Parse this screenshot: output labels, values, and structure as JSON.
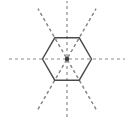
{
  "figure": {
    "caption": "",
    "canvas": {
      "width": 134,
      "height": 119,
      "background": "#ffffff"
    },
    "center": {
      "x": 67,
      "y": 59
    },
    "shape": {
      "name": "regular-hexagon",
      "sides": 6,
      "orientation": "flat-top",
      "circumradius": 24.5,
      "stroke_color": "#4a4a4a",
      "stroke_width": 1.4,
      "fill": "none",
      "vertices": [
        {
          "label": "right",
          "x": 91.5,
          "y": 59.0
        },
        {
          "label": "top-right",
          "x": 79.25,
          "y": 37.8
        },
        {
          "label": "top-left",
          "x": 54.75,
          "y": 37.8
        },
        {
          "label": "left",
          "x": 42.5,
          "y": 59.0
        },
        {
          "label": "bottom-left",
          "x": 54.75,
          "y": 80.2
        },
        {
          "label": "bottom-right",
          "x": 79.25,
          "y": 80.2
        }
      ]
    },
    "symmetry_lines": {
      "count": 6,
      "stroke_color": "#8a8a8a",
      "stroke_width": 1.2,
      "dash_pattern": "3 3",
      "extent_radius": 58,
      "lines": [
        {
          "name": "vertex-axis-horizontal",
          "type": "vertex-to-vertex",
          "angle_deg": 0
        },
        {
          "name": "edge-axis-60",
          "type": "edge-to-edge",
          "angle_deg": 60
        },
        {
          "name": "vertex-axis-120",
          "type": "vertex-to-vertex",
          "angle_deg": 120
        },
        {
          "name": "edge-axis-vertical",
          "type": "edge-to-edge",
          "angle_deg": 90
        },
        {
          "name": "vertex-axis-60",
          "type": "vertex-to-vertex",
          "angle_deg": 60
        },
        {
          "name": "edge-axis-120",
          "type": "edge-to-edge",
          "angle_deg": 120
        }
      ]
    },
    "center_dot": {
      "radius": 2.2,
      "color": "#3a3a3a"
    }
  }
}
